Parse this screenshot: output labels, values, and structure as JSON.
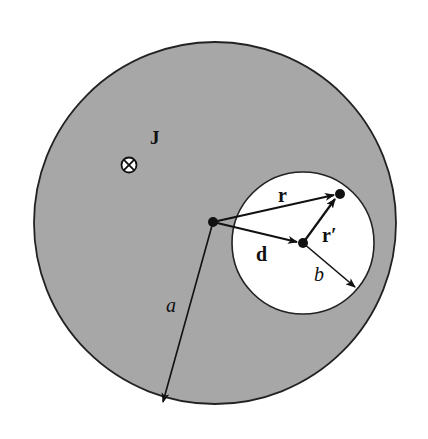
{
  "figure": {
    "colors": {
      "conductor_fill": "#a7a7a7",
      "hole_fill": "#ffffff",
      "outline": "#222222",
      "ink": "#111111"
    },
    "labels": {
      "current_density": "J",
      "position_vector": "r",
      "offset_vector": "d",
      "relative_vector": "r′",
      "outer_radius": "a",
      "hole_radius": "b"
    },
    "symbols": {
      "current_direction": "into-page"
    }
  }
}
